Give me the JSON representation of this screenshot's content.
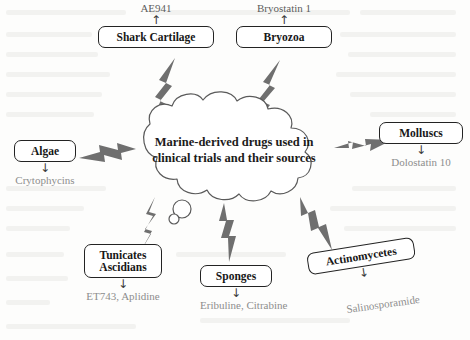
{
  "diagram": {
    "type": "cloud-concept-map",
    "title": "Marine-derived drugs used in clinical trials and their sources",
    "cloud": {
      "text_line1": "Marine-derived drugs used in",
      "text_line2": "clinical trials and their sources"
    },
    "colors": {
      "background": "#fdfdfc",
      "box_border": "#232323",
      "box_text": "#171717",
      "cloud_outline": "#5a5a5a",
      "bolt_fill": "#6f6f6f",
      "compound_text": "#8d8d8d",
      "label_text": "#5d5d5d"
    },
    "nodes": [
      {
        "id": "shark-cartilage",
        "label": "Shark Cartilage",
        "above_label": "AE941",
        "above_arrow": "↑",
        "compound": null,
        "compound_arrow": null,
        "rotated": false
      },
      {
        "id": "bryozoa",
        "label": "Bryozoa",
        "above_label": "Bryostatin 1",
        "above_arrow": "↑",
        "compound": null,
        "compound_arrow": null,
        "rotated": false
      },
      {
        "id": "algae",
        "label": "Algae",
        "above_label": null,
        "above_arrow": null,
        "compound": "Crytophycins",
        "compound_arrow": "↓",
        "rotated": false
      },
      {
        "id": "molluscs",
        "label": "Molluscs",
        "above_label": null,
        "above_arrow": null,
        "compound": "Dolostatin 10",
        "compound_arrow": "↓",
        "rotated": false
      },
      {
        "id": "tunicates-ascidians",
        "label_line1": "Tunicates",
        "label_line2": "Ascidians",
        "above_label": null,
        "above_arrow": null,
        "compound": "ET743, Aplidine",
        "compound_arrow": "↓",
        "rotated": false
      },
      {
        "id": "sponges",
        "label": "Sponges",
        "above_label": null,
        "above_arrow": null,
        "compound": "Eribuline, Citrabine",
        "compound_arrow": "↓",
        "rotated": false
      },
      {
        "id": "actinomycetes",
        "label": "Actinomycetes",
        "above_label": null,
        "above_arrow": null,
        "compound": "Salinosporamide",
        "compound_arrow": "↓",
        "rotated": true
      }
    ]
  }
}
